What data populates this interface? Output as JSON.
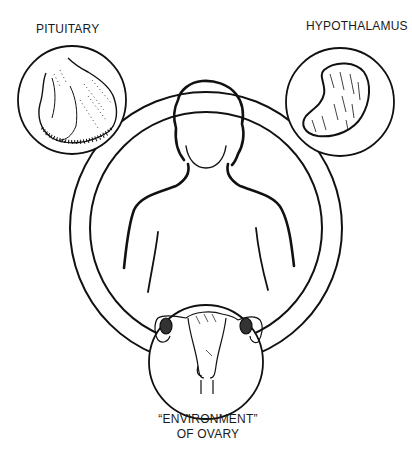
{
  "diagram": {
    "labels": {
      "pituitary": "PITUITARY",
      "hypothalamus": "HYPOTHALAMUS",
      "ovary_line1": "“ENVIRONMENT”",
      "ovary_line2": "OF OVARY"
    },
    "nodes": [
      {
        "id": "pituitary",
        "label": "PITUITARY",
        "illustration": "pituitary-gland"
      },
      {
        "id": "hypothalamus",
        "label": "HYPOTHALAMUS",
        "illustration": "hypothalamus"
      },
      {
        "id": "ovary",
        "label": "“ENVIRONMENT” OF OVARY",
        "illustration": "uterus-and-ovaries"
      }
    ],
    "center": {
      "illustration": "female-figure-silhouette"
    },
    "connector": "ring linking all three nodes around central figure",
    "colors": {
      "ink": "#111111",
      "background": "#ffffff"
    }
  }
}
